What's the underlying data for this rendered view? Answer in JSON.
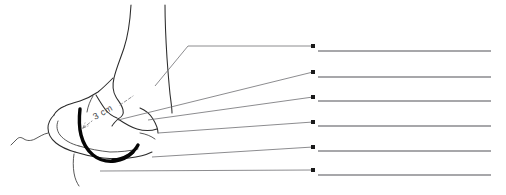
{
  "figure": {
    "background_color": "#ffffff",
    "width": 506,
    "height": 195,
    "annotation": {
      "measurement_label": "3 cm",
      "measurement_rotation_deg": -29,
      "label_color": "#4a4a4e"
    },
    "colors": {
      "outline": "#2b2b2b",
      "outline_thin": "#3a3a3a",
      "emphasis": "#050505",
      "leader": "#6e6e72",
      "answer_rule": "#8a8a8e",
      "bullet": "#1a1a1a"
    },
    "leader_lines": [
      {
        "id": "leader-1",
        "points": "155,86 188,46 313,46"
      },
      {
        "id": "leader-2",
        "points": "118,120 313,72"
      },
      {
        "id": "leader-3",
        "points": "148,120 313,97"
      },
      {
        "id": "leader-4",
        "points": "158,133 313,122"
      },
      {
        "id": "leader-5",
        "points": "152,157 313,147"
      },
      {
        "id": "leader-6",
        "points": "100,171 313,170"
      }
    ],
    "answer_lines": [
      {
        "id": "answer-line-1",
        "bullet_x": 313,
        "bullet_y": 46,
        "rule_y": 51,
        "x1": 318,
        "x2": 491,
        "value": ""
      },
      {
        "id": "answer-line-2",
        "bullet_x": 313,
        "bullet_y": 72,
        "rule_y": 77,
        "x1": 318,
        "x2": 491,
        "value": ""
      },
      {
        "id": "answer-line-3",
        "bullet_x": 313,
        "bullet_y": 97,
        "rule_y": 101,
        "x1": 318,
        "x2": 491,
        "value": ""
      },
      {
        "id": "answer-line-4",
        "bullet_x": 313,
        "bullet_y": 122,
        "rule_y": 126,
        "x1": 318,
        "x2": 491,
        "value": ""
      },
      {
        "id": "answer-line-5",
        "bullet_x": 313,
        "bullet_y": 147,
        "rule_y": 151,
        "x1": 318,
        "x2": 491,
        "value": ""
      },
      {
        "id": "answer-line-6",
        "bullet_x": 313,
        "bullet_y": 170,
        "rule_y": 175,
        "x1": 318,
        "x2": 491,
        "value": ""
      }
    ]
  }
}
